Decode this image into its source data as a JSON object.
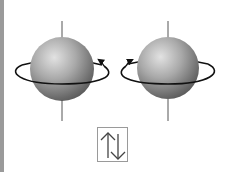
{
  "diagram": {
    "left_particle": {
      "label": "spin up",
      "rotation": "counterclockwise",
      "center": [
        62,
        69
      ],
      "radius": 32
    },
    "right_particle": {
      "label": "spin down",
      "rotation": "clockwise",
      "center": [
        168,
        68
      ],
      "radius": 31
    },
    "symbol_box": {
      "symbol": "↑↓",
      "meaning": "paired spins (up and down)"
    },
    "colors": {
      "sphere_light": "#d8d8d8",
      "sphere_dark": "#4a4a4a",
      "ring": "#111111",
      "axis": "#555555",
      "border_bar": "#9a9a9a"
    }
  }
}
